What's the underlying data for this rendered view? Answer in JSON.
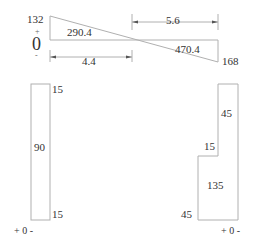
{
  "moment_diagram": {
    "left_value": "132",
    "right_value": "168",
    "left_area": "290.4",
    "right_area": "470.4",
    "zero_label": "0",
    "plus_sign": "+",
    "minus_sign": "-",
    "dim_left": "4.4",
    "dim_right": "5.6"
  },
  "left_shear": {
    "top_value": "15",
    "middle_value": "90",
    "bottom_value": "15",
    "axis_label": "+ 0 -"
  },
  "right_shear": {
    "upper_value": "45",
    "step_value": "15",
    "lower_value": "135",
    "bottom_value": "45",
    "axis_label": "+ 0 -"
  },
  "colors": {
    "line": "#b0b0b0",
    "text": "#333333"
  }
}
